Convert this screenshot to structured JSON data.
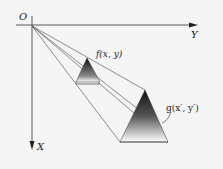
{
  "diagram": {
    "origin_label": "O",
    "x_axis_label": "X",
    "y_axis_label": "Y",
    "object_label": "f(x, y)",
    "image_label": "g(x′, y′)"
  },
  "colors": {
    "line": "#333333",
    "shade_dark": "#111111",
    "shade_light": "#ffffff",
    "background": "#f5f5f5"
  }
}
